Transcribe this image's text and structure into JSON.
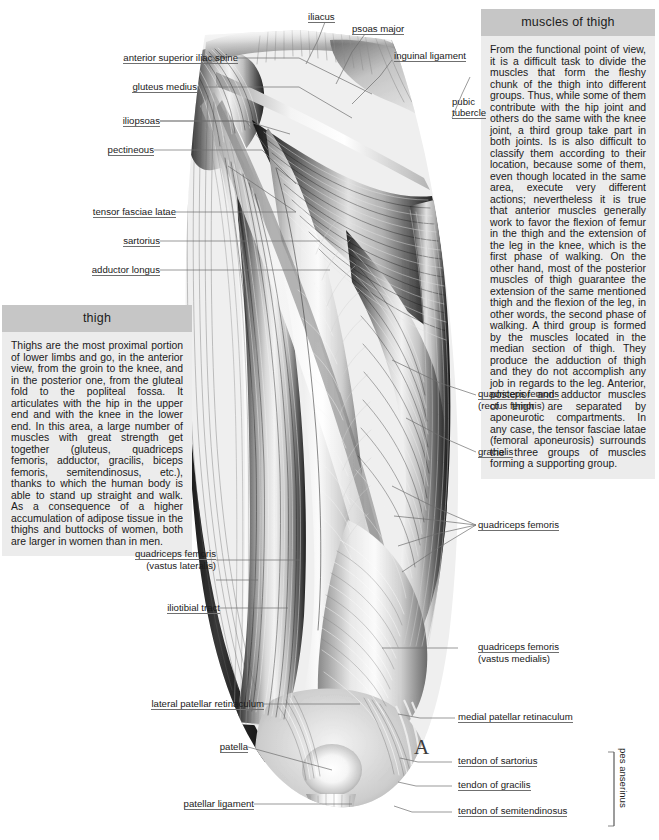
{
  "figure": {
    "panel_marker": "A"
  },
  "panels": [
    {
      "id": "muscles-of-thigh",
      "heading": "muscles of thigh",
      "body": "From the functional point of view, it is a difficult task to divide the muscles that form the fleshy chunk of the thigh into different groups. Thus, while some of them contribute with the hip joint and others do the same with the knee joint, a third group take part in both joints. Is is also difficult to classify them according to their location, because some of them, even though located in the same area, execute very different actions; nevertheless it is true that anterior muscles generally work to favor the flexion of femur in the thigh and the extension of the leg in the knee, which is the first phase of walking. On the other hand, most of the posterior muscles of thigh guarantee the extension of the same mentioned thigh and the flexion of the leg, in other words, the second phase of walking. A third group is formed by the muscles located in the median section of thigh. They produce the adduction of thigh and they do not accomplish any job in regards to the leg. Anterior, posterior and adductor muscles of thigh are separated by aponeurotic compartments. In any case, the tensor fasciae latae (femoral aponeurosis) surrounds the three groups of muscles forming a supporting group."
    },
    {
      "id": "thigh",
      "heading": "thigh",
      "body": "Thighs are the most proximal portion of lower limbs and go, in the anterior view, from the groin to the knee, and in the posterior one, from the gluteal fold to the popliteal fossa. It articulates with the hip in the upper end and with the knee in the lower end. In this area, a large number of muscles with great strength get together (gluteus, quadriceps femoris, adductor, gracilis, biceps femoris, semitendinosus, etc.), thanks to which the human body is able to stand up straight and walk. As a consequence of a higher accumulation of adipose tissue in the thighs and buttocks of women, both are larger in women than in men."
    }
  ],
  "labels_left": [
    {
      "key": "anterior-superior-iliac-spine",
      "text": "anterior superior iliac spine"
    },
    {
      "key": "gluteus-medius",
      "text": "gluteus medius"
    },
    {
      "key": "iliopsoas",
      "text": "iliopsoas"
    },
    {
      "key": "pectineous",
      "text": "pectineous"
    },
    {
      "key": "tensor-fasciae-latae",
      "text": "tensor fasciae latae"
    },
    {
      "key": "sartorius",
      "text": "sartorius"
    },
    {
      "key": "adductor-longus",
      "text": "adductor longus"
    },
    {
      "key": "quadriceps-femoris-vastus-lateralis",
      "text": "quadriceps femoris",
      "text2": "(vastus lateralis)"
    },
    {
      "key": "iliotibial-tract",
      "text": "iliotibial tract"
    },
    {
      "key": "lateral-patellar-retinaculum",
      "text": "lateral patellar retinaculum"
    },
    {
      "key": "patella",
      "text": "patella"
    },
    {
      "key": "patellar-ligament",
      "text": "patellar ligament"
    }
  ],
  "labels_top": [
    {
      "key": "iliacus",
      "text": "iliacus"
    },
    {
      "key": "psoas-major",
      "text": "psoas major"
    },
    {
      "key": "inguinal-ligament",
      "text": "inguinal ligament"
    },
    {
      "key": "pubic-tubercle",
      "text": "pubic",
      "text2": "tubercle"
    }
  ],
  "labels_right": [
    {
      "key": "quadriceps-femoris-rectus-femoris",
      "text": "quadriceps femoris",
      "text2": "(rectus femoris)"
    },
    {
      "key": "gracialis",
      "text": "gracialis"
    },
    {
      "key": "quadriceps-femoris",
      "text": "quadriceps femoris"
    },
    {
      "key": "quadriceps-femoris-vastus-medialis",
      "text": "quadriceps femoris",
      "text2": "(vastus medialis)"
    },
    {
      "key": "medial-patellar-retinaculum",
      "text": "medial patellar retinaculum"
    },
    {
      "key": "tendon-of-sartorius",
      "text": "tendon of sartorius"
    },
    {
      "key": "tendon-of-gracilis",
      "text": "tendon of gracilis"
    },
    {
      "key": "tendon-of-semitendinosus",
      "text": "tendon of semitendinosus"
    }
  ],
  "bracket_label": {
    "key": "pes-anserinus",
    "text": "pes anserinus"
  },
  "colors": {
    "panel_header_bg": "#c6c6c6",
    "panel_body_bg": "#ececec",
    "text": "#1a1a1a",
    "leader_line": "#6f6f6f",
    "page_bg": "#ffffff"
  }
}
